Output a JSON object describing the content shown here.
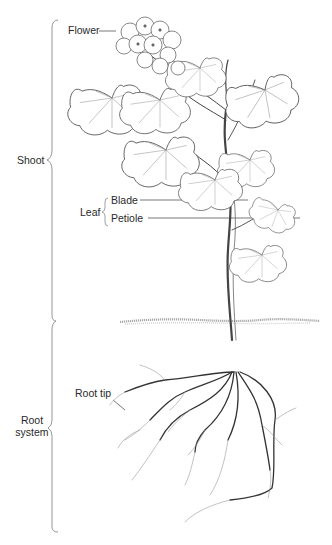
{
  "diagram": {
    "labels": {
      "flower": "Flower",
      "shoot": "Shoot",
      "leaf": "Leaf",
      "blade": "Blade",
      "petiole": "Petiole",
      "root_tip": "Root tip",
      "root_system_line1": "Root",
      "root_system_line2": "system"
    },
    "colors": {
      "ink": "#2a2a2a",
      "line": "#8a8a8a",
      "soil": "#9a9a9a"
    }
  }
}
